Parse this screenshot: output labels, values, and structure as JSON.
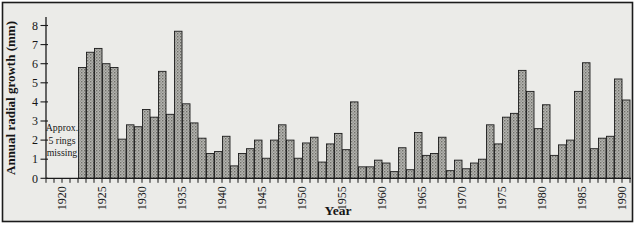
{
  "figure": {
    "background": "#ebebe8",
    "frame_color": "#1b1b1b",
    "bar_fill": "#b5b5b1",
    "bar_dot": "#6f6f69",
    "bar_stroke": "#1c1c1c",
    "axis_color": "#1b1b1b"
  },
  "chart_data": {
    "type": "bar",
    "title": "",
    "xlabel": "Year",
    "ylabel": "Annual radial growth (mm)",
    "ylim": [
      0,
      8
    ],
    "xlim": [
      1918,
      1991
    ],
    "grid": false,
    "legend": false,
    "yticks": [
      0,
      1,
      2,
      3,
      4,
      5,
      6,
      7,
      8
    ],
    "xtick_labels": [
      1920,
      1925,
      1930,
      1935,
      1940,
      1945,
      1950,
      1955,
      1960,
      1965,
      1970,
      1975,
      1980,
      1985,
      1990
    ],
    "minor_ticks_every_year_from": 1918,
    "minor_ticks_every_year_to": 1991,
    "annotation": {
      "lines": [
        "Approx.",
        "5 rings",
        "missing"
      ]
    },
    "years": [
      1922,
      1923,
      1924,
      1925,
      1926,
      1927,
      1928,
      1929,
      1930,
      1931,
      1932,
      1933,
      1934,
      1935,
      1936,
      1937,
      1938,
      1939,
      1940,
      1941,
      1942,
      1943,
      1944,
      1945,
      1946,
      1947,
      1948,
      1949,
      1950,
      1951,
      1952,
      1953,
      1954,
      1955,
      1956,
      1957,
      1958,
      1959,
      1960,
      1961,
      1962,
      1963,
      1964,
      1965,
      1966,
      1967,
      1968,
      1969,
      1970,
      1971,
      1972,
      1973,
      1974,
      1975,
      1976,
      1977,
      1978,
      1979,
      1980,
      1981,
      1982,
      1983,
      1984,
      1985,
      1986,
      1987,
      1988,
      1989,
      1990
    ],
    "values": [
      5.8,
      6.6,
      6.8,
      6.0,
      5.8,
      2.05,
      2.8,
      2.7,
      3.6,
      3.2,
      5.6,
      3.35,
      7.7,
      3.9,
      2.9,
      2.1,
      1.3,
      1.4,
      2.2,
      0.65,
      1.3,
      1.55,
      2.0,
      1.05,
      2.0,
      2.8,
      2.0,
      1.05,
      1.85,
      2.15,
      0.85,
      1.8,
      2.35,
      1.5,
      4.0,
      0.6,
      0.6,
      0.95,
      0.8,
      0.35,
      1.6,
      0.45,
      2.4,
      1.2,
      1.3,
      2.15,
      0.4,
      0.95,
      0.5,
      0.8,
      1.0,
      2.8,
      1.8,
      3.2,
      3.4,
      5.65,
      4.55,
      2.6,
      3.85,
      1.2,
      1.75,
      2.0,
      4.55,
      6.05,
      1.55,
      2.1,
      2.2,
      5.2,
      4.1
    ]
  }
}
